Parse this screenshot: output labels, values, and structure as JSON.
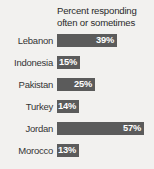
{
  "chart_data": {
    "type": "bar",
    "orientation": "horizontal",
    "title": "Percent responding often or sometimes",
    "title_lines": [
      "Percent responding",
      "often or sometimes"
    ],
    "categories": [
      "Lebanon",
      "Indonesia",
      "Pakistan",
      "Turkey",
      "Jordan",
      "Morocco"
    ],
    "values": [
      39,
      15,
      25,
      14,
      57,
      13
    ],
    "value_labels": [
      "39%",
      "15%",
      "25%",
      "14%",
      "57%",
      "13%"
    ],
    "xlabel": "",
    "ylabel": "",
    "xlim": [
      0,
      62
    ],
    "grid": false,
    "legend": null,
    "bars": [
      {
        "label": "Lebanon",
        "value": 39,
        "value_label": "39%"
      },
      {
        "label": "Indonesia",
        "value": 15,
        "value_label": "15%"
      },
      {
        "label": "Pakistan",
        "value": 25,
        "value_label": "25%"
      },
      {
        "label": "Turkey",
        "value": 14,
        "value_label": "14%"
      },
      {
        "label": "Jordan",
        "value": 57,
        "value_label": "57%"
      },
      {
        "label": "Morocco",
        "value": 13,
        "value_label": "13%"
      }
    ],
    "colors": {
      "bar_fill": "#5b5b5b",
      "value_text": "#ffffff",
      "category_text": "#353535",
      "title_text": "#2b2b2b",
      "background": "#f2f1ef"
    }
  }
}
